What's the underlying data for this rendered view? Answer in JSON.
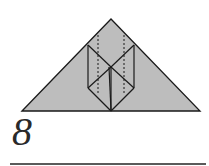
{
  "step": {
    "number": "8"
  },
  "colors": {
    "paper": "#bdbdbd",
    "line": "#1a1a1a",
    "rule": "#5a5a5a"
  },
  "diagram": {
    "lines": {
      "valley_hidden": "dashed"
    }
  }
}
